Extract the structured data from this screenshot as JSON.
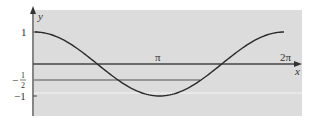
{
  "chart_data": {
    "type": "line",
    "title": "",
    "xlabel": "x",
    "ylabel": "y",
    "function": "y = cos(x)",
    "x_range": [
      0,
      6.2832
    ],
    "ylim": [
      -1.5,
      1.5
    ],
    "x_ticks": [
      "π",
      "2π"
    ],
    "y_ticks": [
      "1",
      "-1/2",
      "-1"
    ],
    "horizontal_line": {
      "y": -0.5,
      "label": "-1/2"
    },
    "series": [
      {
        "name": "cos x",
        "x": [
          0,
          0.7854,
          1.5708,
          2.3562,
          3.1416,
          3.927,
          4.7124,
          5.4978,
          6.2832
        ],
        "values": [
          1,
          0.707,
          0,
          -0.707,
          -1,
          -0.707,
          0,
          0.707,
          1
        ]
      }
    ],
    "grid": false,
    "background": "#dcdcdc"
  },
  "labels": {
    "y_axis": "y",
    "x_axis": "x",
    "pi": "π",
    "two_pi": "2π",
    "one": "1",
    "minus": "−",
    "half_num": "1",
    "half_den": "2",
    "minus_one": "−1"
  },
  "colors": {
    "plot_bg": "#dcdcdc",
    "curve": "#2a2a2a",
    "axis": "#444444"
  }
}
